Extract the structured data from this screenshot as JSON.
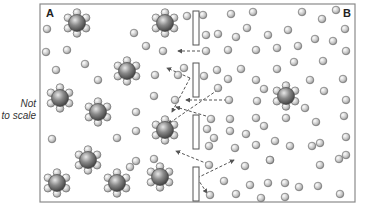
{
  "annotation": {
    "line1": "Not",
    "line2": "to scale"
  },
  "labels": {
    "left_region": "A",
    "right_region": "B"
  },
  "colors": {
    "frame": "#8a8a8a",
    "membrane_fill": "#ffffff",
    "membrane_stroke": "#555555",
    "arrow": "#555555"
  },
  "frame": {
    "x": 40,
    "y": 4,
    "w": 315,
    "h": 198
  },
  "membrane": {
    "x": 193,
    "w": 6,
    "segments": [
      {
        "y": 11,
        "h": 34
      },
      {
        "y": 63,
        "h": 34
      },
      {
        "y": 115,
        "h": 34
      },
      {
        "y": 167,
        "h": 34
      }
    ]
  },
  "hydrated_ions": [
    {
      "x": 77,
      "y": 23
    },
    {
      "x": 165,
      "y": 23
    },
    {
      "x": 127,
      "y": 71
    },
    {
      "x": 60,
      "y": 98
    },
    {
      "x": 98,
      "y": 112
    },
    {
      "x": 165,
      "y": 130
    },
    {
      "x": 88,
      "y": 160
    },
    {
      "x": 57,
      "y": 183
    },
    {
      "x": 117,
      "y": 183
    },
    {
      "x": 160,
      "y": 177
    },
    {
      "x": 286,
      "y": 96
    }
  ],
  "water_molecules": [
    {
      "x": 47,
      "y": 29
    },
    {
      "x": 134,
      "y": 33
    },
    {
      "x": 46,
      "y": 52
    },
    {
      "x": 67,
      "y": 50
    },
    {
      "x": 85,
      "y": 64
    },
    {
      "x": 146,
      "y": 46
    },
    {
      "x": 163,
      "y": 51
    },
    {
      "x": 56,
      "y": 70
    },
    {
      "x": 98,
      "y": 80
    },
    {
      "x": 155,
      "y": 75
    },
    {
      "x": 178,
      "y": 75
    },
    {
      "x": 184,
      "y": 68
    },
    {
      "x": 154,
      "y": 96
    },
    {
      "x": 175,
      "y": 100
    },
    {
      "x": 136,
      "y": 112
    },
    {
      "x": 136,
      "y": 131
    },
    {
      "x": 52,
      "y": 139
    },
    {
      "x": 117,
      "y": 138
    },
    {
      "x": 136,
      "y": 161
    },
    {
      "x": 130,
      "y": 167
    },
    {
      "x": 154,
      "y": 159
    },
    {
      "x": 187,
      "y": 16
    },
    {
      "x": 203,
      "y": 15
    },
    {
      "x": 231,
      "y": 14
    },
    {
      "x": 253,
      "y": 12
    },
    {
      "x": 302,
      "y": 12
    },
    {
      "x": 322,
      "y": 19
    },
    {
      "x": 336,
      "y": 10
    },
    {
      "x": 206,
      "y": 35
    },
    {
      "x": 218,
      "y": 34
    },
    {
      "x": 236,
      "y": 37
    },
    {
      "x": 247,
      "y": 28
    },
    {
      "x": 268,
      "y": 35
    },
    {
      "x": 288,
      "y": 30
    },
    {
      "x": 315,
      "y": 39
    },
    {
      "x": 333,
      "y": 41
    },
    {
      "x": 345,
      "y": 29
    },
    {
      "x": 206,
      "y": 51
    },
    {
      "x": 228,
      "y": 50
    },
    {
      "x": 256,
      "y": 50
    },
    {
      "x": 277,
      "y": 48
    },
    {
      "x": 298,
      "y": 46
    },
    {
      "x": 346,
      "y": 51
    },
    {
      "x": 294,
      "y": 62
    },
    {
      "x": 323,
      "y": 61
    },
    {
      "x": 217,
      "y": 70
    },
    {
      "x": 241,
      "y": 69
    },
    {
      "x": 277,
      "y": 69
    },
    {
      "x": 204,
      "y": 76
    },
    {
      "x": 228,
      "y": 79
    },
    {
      "x": 256,
      "y": 80
    },
    {
      "x": 310,
      "y": 80
    },
    {
      "x": 343,
      "y": 79
    },
    {
      "x": 218,
      "y": 88
    },
    {
      "x": 229,
      "y": 100
    },
    {
      "x": 257,
      "y": 101
    },
    {
      "x": 264,
      "y": 89
    },
    {
      "x": 324,
      "y": 91
    },
    {
      "x": 346,
      "y": 100
    },
    {
      "x": 305,
      "y": 108
    },
    {
      "x": 211,
      "y": 119
    },
    {
      "x": 230,
      "y": 119
    },
    {
      "x": 256,
      "y": 118
    },
    {
      "x": 286,
      "y": 118
    },
    {
      "x": 344,
      "y": 116
    },
    {
      "x": 264,
      "y": 126
    },
    {
      "x": 316,
      "y": 122
    },
    {
      "x": 207,
      "y": 129
    },
    {
      "x": 214,
      "y": 138
    },
    {
      "x": 246,
      "y": 134
    },
    {
      "x": 230,
      "y": 131
    },
    {
      "x": 256,
      "y": 145
    },
    {
      "x": 275,
      "y": 141
    },
    {
      "x": 312,
      "y": 146
    },
    {
      "x": 346,
      "y": 137
    },
    {
      "x": 209,
      "y": 146
    },
    {
      "x": 235,
      "y": 148
    },
    {
      "x": 270,
      "y": 160
    },
    {
      "x": 290,
      "y": 146
    },
    {
      "x": 320,
      "y": 143
    },
    {
      "x": 209,
      "y": 165
    },
    {
      "x": 245,
      "y": 166
    },
    {
      "x": 270,
      "y": 160
    },
    {
      "x": 320,
      "y": 165
    },
    {
      "x": 339,
      "y": 159
    },
    {
      "x": 346,
      "y": 155
    },
    {
      "x": 224,
      "y": 181
    },
    {
      "x": 250,
      "y": 185
    },
    {
      "x": 268,
      "y": 183
    },
    {
      "x": 285,
      "y": 183
    },
    {
      "x": 299,
      "y": 187
    },
    {
      "x": 318,
      "y": 186
    },
    {
      "x": 210,
      "y": 195
    },
    {
      "x": 236,
      "y": 194
    },
    {
      "x": 261,
      "y": 198
    },
    {
      "x": 285,
      "y": 197
    },
    {
      "x": 340,
      "y": 194
    }
  ],
  "arrows": [
    {
      "x1": 205,
      "y1": 51,
      "x2": 178,
      "y2": 51
    },
    {
      "x1": 190,
      "y1": 78,
      "x2": 167,
      "y2": 68
    },
    {
      "x1": 190,
      "y1": 78,
      "x2": 172,
      "y2": 112
    },
    {
      "x1": 222,
      "y1": 87,
      "x2": 168,
      "y2": 124
    },
    {
      "x1": 227,
      "y1": 100,
      "x2": 186,
      "y2": 100
    },
    {
      "x1": 206,
      "y1": 116,
      "x2": 176,
      "y2": 107
    },
    {
      "x1": 208,
      "y1": 164,
      "x2": 176,
      "y2": 151
    },
    {
      "x1": 197,
      "y1": 178,
      "x2": 234,
      "y2": 160
    },
    {
      "x1": 197,
      "y1": 178,
      "x2": 207,
      "y2": 193
    }
  ]
}
